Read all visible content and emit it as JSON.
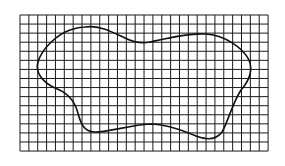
{
  "figure": {
    "grid": {
      "x": 20,
      "y": 15,
      "columns": 28,
      "rows": 15,
      "cell_width": 8.86,
      "cell_height": 9.07,
      "line_color": "#1a1a1a",
      "background": "#ffffff"
    },
    "curve": {
      "stroke_color": "#111111",
      "stroke_width": 1.6,
      "path": "M 85 27 C 100 25, 112 32, 125 38 C 133 42, 140 44, 150 42 C 168 38, 188 33, 205 34 C 225 35, 243 48, 249 60 C 254 72, 248 82, 241 90 C 232 104, 228 122, 222 132 C 216 140, 206 140, 196 136 C 182 130, 165 124, 150 124 C 130 125, 110 132, 95 132 C 82 132, 80 120, 77 110 C 73 98, 66 92, 55 88 C 42 82, 35 72, 38 62 C 42 48, 58 34, 70 30 C 76 28, 80 27, 85 27 Z"
    }
  }
}
